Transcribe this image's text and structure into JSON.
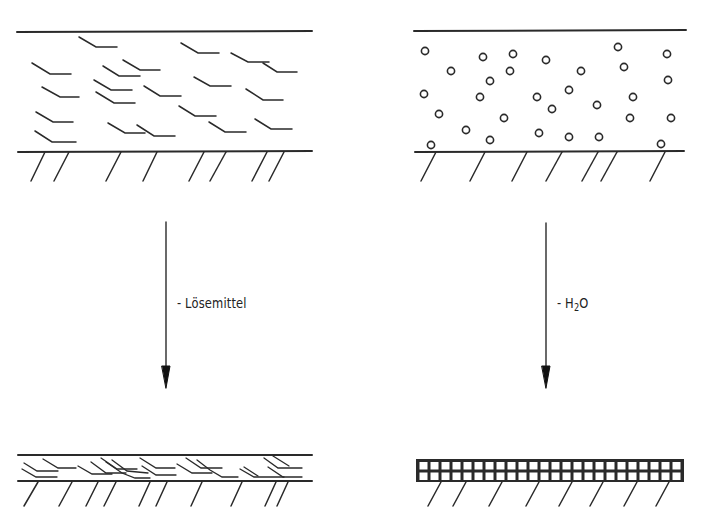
{
  "diagram": {
    "left_process": {
      "arrow_label": "- Lösemittel",
      "before_state": "solvent-based coating with dispersed particles",
      "after_state": "compacted overlapping film"
    },
    "right_process": {
      "arrow_label_prefix": "- H",
      "arrow_label_subscript": "2",
      "arrow_label_suffix": "O",
      "before_state": "water-based coating with dispersed spherical particles",
      "after_state": "packed grid-structured film"
    },
    "colors": {
      "stroke": "#2a2a2a",
      "background": "#ffffff"
    }
  }
}
